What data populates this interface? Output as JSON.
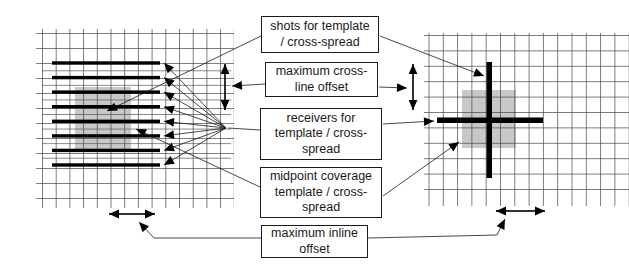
{
  "figure": {
    "labels": {
      "shots": {
        "lines": [
          "shots for template",
          "/ cross-spread"
        ]
      },
      "crossline_offset": {
        "lines": [
          "maximum cross-",
          "line offset"
        ]
      },
      "receivers": {
        "lines": [
          "receivers for",
          "template / cross-",
          "spread"
        ]
      },
      "midpoint": {
        "lines": [
          "midpoint coverage",
          "template / cross-",
          "spread"
        ]
      },
      "inline_offset": {
        "lines": [
          "maximum inline",
          "offset"
        ]
      }
    },
    "colors": {
      "ink": "#000000",
      "grid_line": "#474747",
      "shaded_area": "#c8c8c8",
      "background": "#ffffff"
    }
  }
}
